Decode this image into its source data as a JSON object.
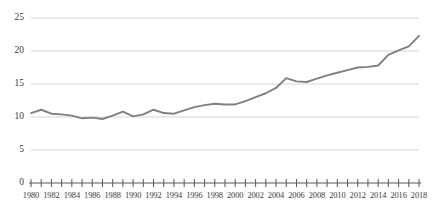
{
  "chart_data": {
    "type": "line",
    "title": "",
    "subtitle": "",
    "xlabel": "",
    "ylabel": "",
    "xlim": [
      1980,
      2018
    ],
    "ylim": [
      0,
      25
    ],
    "grid": true,
    "legend": null,
    "line_color": "#808080",
    "gridline_color": "#d0d0d0",
    "axis_color": "#595959",
    "y_ticks": [
      "0",
      "5",
      "10",
      "15",
      "20",
      "25"
    ],
    "y_tick_values": [
      0,
      5,
      10,
      15,
      20,
      25
    ],
    "x_tick_labels": [
      "1980",
      "1982",
      "1984",
      "1986",
      "1988",
      "1990",
      "1992",
      "1994",
      "1996",
      "1998",
      "2000",
      "2002",
      "2004",
      "2006",
      "2008",
      "2010",
      "2012",
      "2014",
      "2016",
      "2018"
    ],
    "x_minor_ticks_every": 1,
    "x": [
      1980,
      1981,
      1982,
      1983,
      1984,
      1985,
      1986,
      1987,
      1988,
      1989,
      1990,
      1991,
      1992,
      1993,
      1994,
      1995,
      1996,
      1997,
      1998,
      1999,
      2000,
      2001,
      2002,
      2003,
      2004,
      2005,
      2006,
      2007,
      2008,
      2009,
      2010,
      2011,
      2012,
      2013,
      2014,
      2015,
      2016,
      2017,
      2018
    ],
    "values": [
      10.6,
      11.1,
      10.5,
      10.4,
      10.2,
      9.8,
      9.9,
      9.7,
      10.2,
      10.8,
      10.1,
      10.4,
      11.1,
      10.6,
      10.5,
      11.0,
      11.5,
      11.8,
      12.0,
      11.9,
      11.9,
      12.4,
      13.0,
      13.6,
      14.4,
      15.9,
      15.4,
      15.3,
      15.8,
      16.3,
      16.7,
      17.1,
      17.5,
      17.6,
      17.8,
      19.4,
      20.1,
      20.7,
      22.3
    ],
    "series": [
      {
        "name": "series-1",
        "values": [
          10.6,
          11.1,
          10.5,
          10.4,
          10.2,
          9.8,
          9.9,
          9.7,
          10.2,
          10.8,
          10.1,
          10.4,
          11.1,
          10.6,
          10.5,
          11.0,
          11.5,
          11.8,
          12.0,
          11.9,
          11.9,
          12.4,
          13.0,
          13.6,
          14.4,
          15.9,
          15.4,
          15.3,
          15.8,
          16.3,
          16.7,
          17.1,
          17.5,
          17.6,
          17.8,
          19.4,
          20.1,
          20.7,
          22.3
        ]
      }
    ]
  }
}
